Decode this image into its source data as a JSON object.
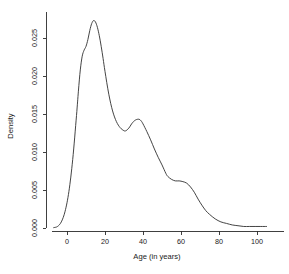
{
  "chart_data": {
    "type": "line",
    "title": "",
    "subtitle": "",
    "xlabel": "Age (in years)",
    "ylabel": "Density",
    "xlim": [
      -12,
      108
    ],
    "ylim": [
      -0.0005,
      0.0285
    ],
    "grid": false,
    "legend": null,
    "xticks": [
      0,
      20,
      40,
      60,
      80,
      100
    ],
    "xticklabels": [
      "0",
      "20",
      "40",
      "60",
      "80",
      "100"
    ],
    "yticks": [
      0.0,
      0.005,
      0.01,
      0.015,
      0.02,
      0.025
    ],
    "yticklabels": [
      "0.000",
      "0.005",
      "0.010",
      "0.015",
      "0.020",
      "0.025"
    ],
    "series": [
      {
        "name": "Age density",
        "x": [
          -7,
          -5,
          -3,
          -1,
          1,
          3,
          5,
          6,
          7,
          8,
          9,
          10,
          11,
          12,
          13,
          14,
          15,
          16,
          17,
          18,
          19,
          20,
          22,
          24,
          26,
          28,
          30,
          31,
          32,
          33,
          34,
          35,
          36,
          37,
          38,
          39,
          40,
          42,
          44,
          46,
          48,
          50,
          52,
          53,
          55,
          57,
          59,
          61,
          63,
          65,
          67,
          69,
          71,
          73,
          75,
          78,
          81,
          84,
          87,
          90,
          93,
          96,
          99,
          102,
          105
        ],
        "y": [
          5e-05,
          0.0002,
          0.0008,
          0.0022,
          0.0048,
          0.009,
          0.0148,
          0.018,
          0.0208,
          0.0226,
          0.0234,
          0.0239,
          0.0248,
          0.026,
          0.0269,
          0.0273,
          0.0271,
          0.0264,
          0.0253,
          0.0239,
          0.0223,
          0.0206,
          0.0176,
          0.0154,
          0.014,
          0.0132,
          0.0128,
          0.0128,
          0.013,
          0.0133,
          0.0137,
          0.014,
          0.0142,
          0.0143,
          0.0143,
          0.0141,
          0.0137,
          0.0127,
          0.0116,
          0.0104,
          0.0093,
          0.0083,
          0.0072,
          0.0068,
          0.0064,
          0.0062,
          0.0062,
          0.0061,
          0.0059,
          0.0054,
          0.0047,
          0.0038,
          0.003,
          0.0023,
          0.0018,
          0.0012,
          0.0008,
          0.0006,
          0.0004,
          0.0003,
          0.0002,
          0.0002,
          0.0002,
          0.0002,
          0.0002
        ]
      }
    ]
  }
}
